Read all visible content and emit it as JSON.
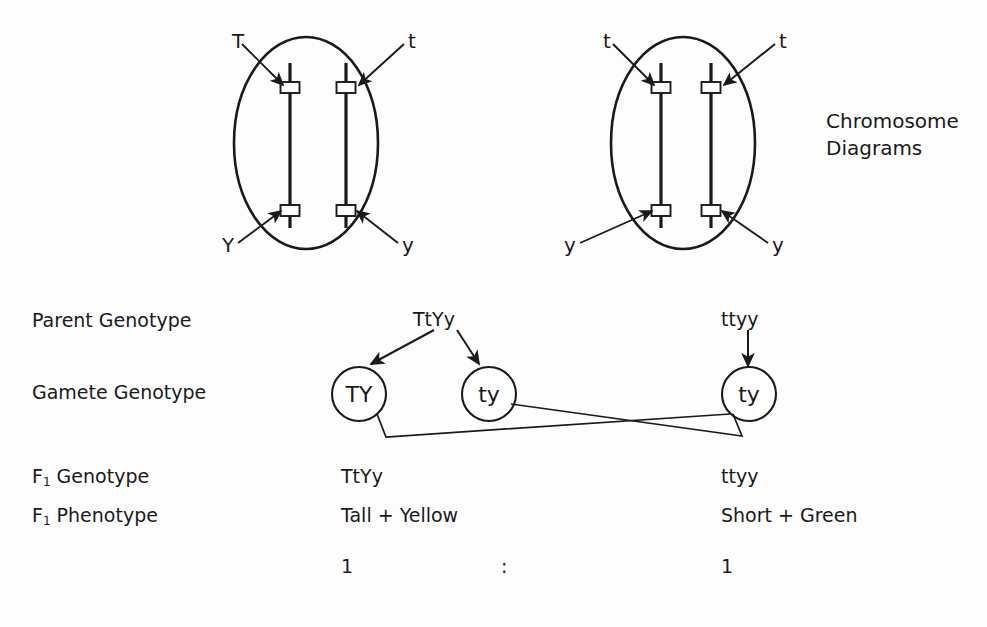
{
  "figure": {
    "caption_line1": "Chromosome",
    "caption_line2": "Diagrams",
    "ink_color": "#1a1a1a",
    "background_color": "#fdfdfd"
  },
  "cells": [
    {
      "name": "left-parent-cell",
      "genotype": "TtYy",
      "top_left_allele": "T",
      "top_right_allele": "t",
      "bottom_left_allele": "Y",
      "bottom_right_allele": "y"
    },
    {
      "name": "right-parent-cell",
      "genotype": "ttyy",
      "top_left_allele": "t",
      "top_right_allele": "t",
      "bottom_left_allele": "y",
      "bottom_right_allele": "y"
    }
  ],
  "rows": [
    {
      "key": "parent_genotype",
      "label": "Parent Genotype",
      "sub": ""
    },
    {
      "key": "gamete_genotype",
      "label": "Gamete Genotype",
      "sub": ""
    },
    {
      "key": "f1_genotype",
      "label": "F",
      "sub": "1",
      "label_tail": " Genotype"
    },
    {
      "key": "f1_phenotype",
      "label": "F",
      "sub": "1",
      "label_tail": " Phenotype"
    }
  ],
  "row_labels": {
    "parent_genotype": "Parent Genotype",
    "gamete_genotype": "Gamete Genotype",
    "f1_genotype_head": "F",
    "f1_genotype_sub": "1",
    "f1_genotype_tail": " Genotype",
    "f1_phenotype_head": "F",
    "f1_phenotype_sub": "1",
    "f1_phenotype_tail": " Phenotype"
  },
  "parents": {
    "left_genotype": "TtYy",
    "right_genotype": "ttyy"
  },
  "gametes": [
    {
      "name": "gamete-ty-upper-left",
      "label": "TY"
    },
    {
      "name": "gamete-ty-middle",
      "label": "ty"
    },
    {
      "name": "gamete-ty-right",
      "label": "ty"
    }
  ],
  "f1": {
    "left_genotype": "TtYy",
    "right_genotype": "ttyy",
    "left_phenotype": "Tall + Yellow",
    "right_phenotype": "Short + Green"
  },
  "ratio": {
    "left": "1",
    "separator": ":",
    "right": "1"
  }
}
